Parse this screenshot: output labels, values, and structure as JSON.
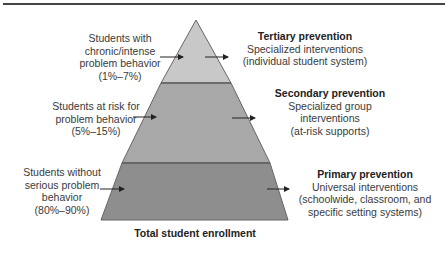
{
  "diagram": {
    "type": "pyramid",
    "colors": {
      "tier_top": "#c8c8c8",
      "tier_middle": "#a8a8a8",
      "tier_bottom": "#8c8c8c",
      "outline": "#555555"
    },
    "left_labels": [
      {
        "line1": "Students with",
        "line2": "chronic/intense",
        "line3": "problem behavior",
        "line4": "(1%–7%)"
      },
      {
        "line1": "Students at risk for",
        "line2": "problem behavior",
        "line3": "(5%–15%)"
      },
      {
        "line1": "Students without",
        "line2": "serious problem",
        "line3": "behavior",
        "line4": "(80%–90%)"
      }
    ],
    "right_labels": [
      {
        "heading": "Tertiary prevention",
        "line1": "Specialized interventions",
        "line2": "(individual student system)"
      },
      {
        "heading": "Secondary prevention",
        "line1": "Specialized group",
        "line2": "interventions",
        "line3": "(at-risk supports)"
      },
      {
        "heading": "Primary prevention",
        "line1": "Universal interventions",
        "line2": "(schoolwide, classroom, and",
        "line3": "specific setting systems)"
      }
    ],
    "base_label": "Total student enrollment"
  }
}
